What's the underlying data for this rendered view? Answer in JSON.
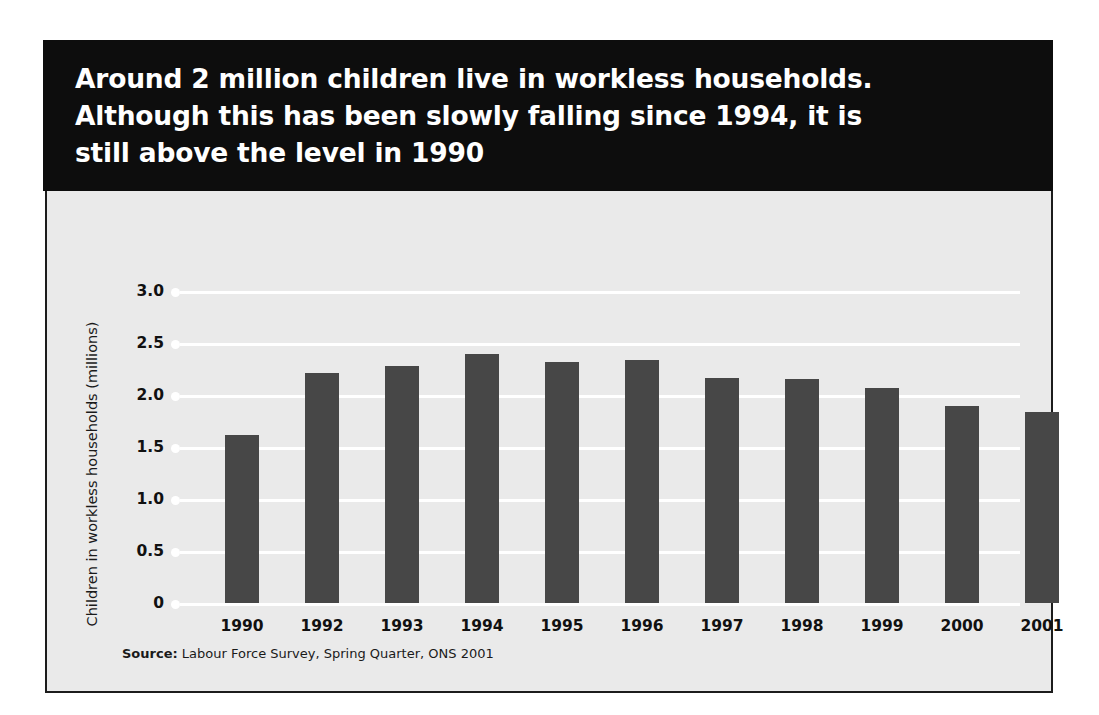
{
  "title": "Around 2 million children live in workless households.\nAlthough this has been slowly falling since 1994, it is\nstill above the level in 1990",
  "source": {
    "label": "Source:",
    "text": " Labour Force Survey, Spring Quarter, ONS 2001"
  },
  "colors": {
    "banner_background": "#0d0d0d",
    "banner_text": "#ffffff",
    "panel_background": "#eaeaea",
    "panel_border": "#1c1c1c",
    "bar": "#474747",
    "gridline": "#ffffff"
  },
  "chart_data": {
    "type": "bar",
    "title": "Around 2 million children live in workless households. Although this has been slowly falling since 1994, it is still above the level in 1990",
    "xlabel": "",
    "ylabel": "Children in workless households (millions)",
    "categories": [
      "1990",
      "1992",
      "1993",
      "1994",
      "1995",
      "1996",
      "1997",
      "1998",
      "1999",
      "2000",
      "2001"
    ],
    "values": [
      1.62,
      2.21,
      2.28,
      2.39,
      2.32,
      2.34,
      2.16,
      2.15,
      2.07,
      1.89,
      1.84
    ],
    "ylim": [
      0,
      3.0
    ],
    "yticks": [
      0,
      0.5,
      1.0,
      1.5,
      2.0,
      2.5,
      3.0
    ],
    "ytick_labels": [
      "0",
      "0.5",
      "1.0",
      "1.5",
      "2.0",
      "2.5",
      "3.0"
    ],
    "grid": true,
    "legend": false,
    "series": [
      {
        "name": "Children in workless households (millions)",
        "values": [
          1.62,
          2.21,
          2.28,
          2.39,
          2.32,
          2.34,
          2.16,
          2.15,
          2.07,
          1.89,
          1.84
        ]
      }
    ]
  }
}
